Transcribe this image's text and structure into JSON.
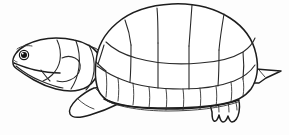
{
  "image": {
    "kind": "line-art-illustration",
    "subject": "turtle",
    "style": "black and white outline coloring-book drawing",
    "orientation": "facing left, side profile",
    "alt_text": "Line drawing of a turtle in side profile facing left, with a large segmented domed shell, scaly neck, front flipper, clawed rear foot and a short pointed tail.",
    "width_px": 289,
    "height_px": 135,
    "background_color": "#fdfdfd",
    "line_color": "#1d1d1d",
    "fill_color": "#ffffff",
    "has_text": false,
    "has_color": false
  },
  "parts": {
    "shell": {
      "label": "Shell (carapace)",
      "vertebral_scutes_count": 5,
      "costal_scutes_count": 5,
      "marginal_scutes_count": 11,
      "description": "Large domed shell occupying the right two thirds of the drawing, divided into polygonal scutes by thin outline segments, with a doubled line along the lower rim."
    },
    "head": {
      "label": "Head",
      "description": "Small wedge-shaped head at the far left with a pointed snout, open jaw line and a round dark eye.",
      "eye": {
        "label": "Eye",
        "shape": "filled dark circle with white highlight",
        "center_x": 24,
        "center_y": 55,
        "radius": 3.4,
        "color": "#141414"
      }
    },
    "neck": {
      "label": "Neck",
      "segments_count": 4,
      "description": "Short thick neck between the head and the shell, marked with transverse scale plates."
    },
    "front_leg": {
      "label": "Front leg (flipper)",
      "description": "Broad paddle-like front limb angled down and to the left beneath the front of the shell."
    },
    "rear_leg": {
      "label": "Rear leg and foot",
      "toes_count": 4,
      "description": "Stubby hind foot below the rear of the shell with four short rounded claws."
    },
    "tail": {
      "label": "Tail",
      "description": "Short pointed triangular tail projecting to the right behind the shell."
    }
  },
  "palette": {
    "background": "#fdfdfd",
    "outline": "#1d1d1d",
    "detail_line": "#333333",
    "eye": "#141414",
    "interior": "#ffffff"
  }
}
